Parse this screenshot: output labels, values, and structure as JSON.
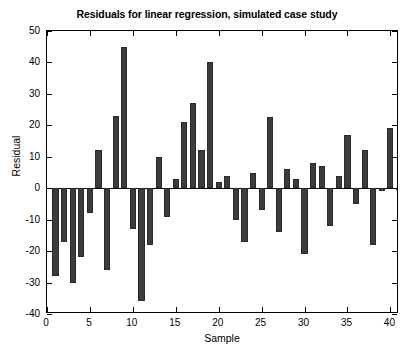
{
  "chart_data": {
    "type": "bar",
    "title": "Residuals for linear regression, simulated case study",
    "xlabel": "Sample",
    "ylabel": "Residual",
    "grid": false,
    "legend": null,
    "xlim": [
      0,
      41
    ],
    "ylim": [
      -40,
      50
    ],
    "xticks": [
      0,
      5,
      10,
      15,
      20,
      25,
      30,
      35,
      40
    ],
    "yticks": [
      -40,
      -30,
      -20,
      -10,
      0,
      10,
      20,
      30,
      40,
      50
    ],
    "xtick_labels": [
      "0",
      "5",
      "10",
      "15",
      "20",
      "25",
      "30",
      "35",
      "40"
    ],
    "ytick_labels": [
      "-40",
      "-30",
      "-20",
      "-10",
      "0",
      "10",
      "20",
      "30",
      "40",
      "50"
    ],
    "bar_color": "#3c3c3c",
    "categories": [
      1,
      2,
      3,
      4,
      5,
      6,
      7,
      8,
      9,
      10,
      11,
      12,
      13,
      14,
      15,
      16,
      17,
      18,
      19,
      20,
      21,
      22,
      23,
      24,
      25,
      26,
      27,
      28,
      29,
      30,
      31,
      32,
      33,
      34,
      35,
      36,
      37,
      38,
      39,
      40,
      41
    ],
    "values": [
      -28,
      -17,
      -30,
      -22,
      -8,
      12,
      -26,
      23,
      45,
      -13,
      -36,
      -18,
      10,
      -9,
      3,
      21,
      27,
      12,
      40,
      2,
      4,
      -10,
      -17,
      5,
      -7,
      22.5,
      -14,
      6,
      3,
      -21,
      8,
      7,
      -12,
      4,
      17,
      -5,
      12,
      -18,
      -1,
      19,
      0
    ]
  },
  "axis": {
    "x_title": "Sample",
    "y_title": "Residual"
  }
}
